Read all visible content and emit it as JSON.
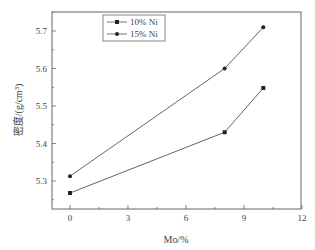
{
  "chart_data": {
    "type": "line",
    "title": "",
    "xlabel": "Mo/%",
    "ylabel": "密度/(g/cm³)",
    "xlim": [
      -1,
      12
    ],
    "ylim": [
      5.23,
      5.755
    ],
    "xticks": [
      0,
      3,
      6,
      9,
      12
    ],
    "yticks": [
      5.3,
      5.4,
      5.5,
      5.6,
      5.7
    ],
    "grid": false,
    "legend_position": "upper-left-inside",
    "series": [
      {
        "name": "10% Ni",
        "marker": "square",
        "x": [
          0,
          8,
          10
        ],
        "y": [
          5.268,
          5.43,
          5.548
        ]
      },
      {
        "name": "15% Ni",
        "marker": "circle",
        "x": [
          0,
          8,
          10
        ],
        "y": [
          5.313,
          5.6,
          5.71
        ]
      }
    ]
  },
  "legend": {
    "items": [
      "10% Ni",
      "15% Ni"
    ]
  },
  "axes": {
    "xlabel": "Mo/%",
    "ylabel": "密度/(g/cm³)",
    "xtick_labels": [
      "0",
      "3",
      "6",
      "9",
      "12"
    ],
    "ytick_labels": [
      "5.3",
      "5.4",
      "5.5",
      "5.6",
      "5.7"
    ]
  }
}
